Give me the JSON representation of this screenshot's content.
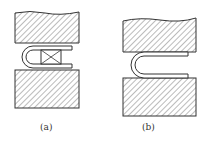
{
  "figure": {
    "panels": [
      {
        "id": "a",
        "label": "(a)",
        "description": "Upper and lower hatched die blocks with U-shaped bent part and crossed box insert"
      },
      {
        "id": "b",
        "label": "(b)",
        "description": "Upper and lower hatched die blocks with U-shaped bent part"
      }
    ],
    "colors": {
      "line": "#333333",
      "background": "#ffffff"
    }
  }
}
